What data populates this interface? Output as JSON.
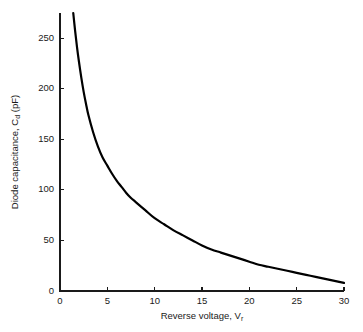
{
  "chart_data": {
    "type": "line",
    "title": "",
    "subtitle": "",
    "xlabel_main": "Reverse voltage, V",
    "xlabel_sub": "r",
    "xlabel": "Reverse voltage, V_r",
    "ylabel_prefix": "Diode capacitance, C",
    "ylabel_sub": "d",
    "ylabel_suffix": " (pF)",
    "ylabel": "Diode capacitance, C_d (pF)",
    "xlim": [
      0,
      30
    ],
    "ylim": [
      0,
      275
    ],
    "xticks": [
      0,
      5,
      10,
      15,
      20,
      25,
      30
    ],
    "yticks": [
      0,
      50,
      100,
      150,
      200,
      250
    ],
    "xtick_labels": [
      "0",
      "5",
      "10",
      "15",
      "20",
      "25",
      "30"
    ],
    "ytick_labels": [
      "0",
      "50",
      "100",
      "150",
      "200",
      "250"
    ],
    "grid": false,
    "legend": false,
    "legend_position": "none",
    "series": [
      {
        "name": "Diode capacitance",
        "color": "#000000",
        "linewidth": 2.2,
        "x": [
          1.4,
          1.6,
          1.8,
          2.0,
          2.25,
          2.5,
          2.75,
          3.0,
          3.5,
          4.0,
          4.5,
          5.0,
          5.5,
          6.0,
          6.5,
          7.0,
          7.5,
          8.0,
          9.0,
          10.0,
          11.0,
          12.0,
          13.0,
          14.0,
          15.0,
          16.0,
          17.0,
          18.0,
          19.0,
          20.0,
          21.0,
          22.0,
          23.0,
          24.0,
          25.0,
          26.0,
          27.0,
          28.0,
          29.0,
          30.0
        ],
        "y": [
          275,
          257,
          241,
          227,
          211,
          197,
          185,
          174,
          157,
          143,
          132,
          124,
          116,
          109,
          103,
          97,
          92,
          88,
          80,
          72,
          66,
          60,
          55,
          50,
          45,
          41,
          38,
          35,
          32,
          29,
          26,
          24,
          22,
          20,
          18,
          16,
          14,
          12,
          10,
          8
        ]
      }
    ],
    "axis_color": "#1a1a1a",
    "background": "#ffffff"
  },
  "geometry": {
    "plot_left_px": 60,
    "plot_right_px": 344,
    "plot_bottom_px": 291,
    "plot_top_px": 13
  }
}
